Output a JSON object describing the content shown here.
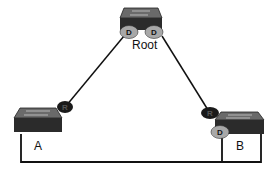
{
  "diagram": {
    "type": "spanning-tree-topology",
    "switches": [
      {
        "id": "root",
        "label": "Root"
      },
      {
        "id": "a",
        "label": "A"
      },
      {
        "id": "b",
        "label": "B"
      }
    ],
    "ports": [
      {
        "switch": "root",
        "role_label": "D",
        "style": "designated"
      },
      {
        "switch": "root",
        "role_label": "D",
        "style": "designated"
      },
      {
        "switch": "a",
        "role_label": "R",
        "style": "root-port"
      },
      {
        "switch": "b",
        "role_label": "R",
        "style": "root-port"
      },
      {
        "switch": "b",
        "role_label": "D",
        "style": "designated"
      }
    ],
    "colors": {
      "designated_port": "#a8a8a8",
      "root_port": "#1a1a1a",
      "switch_body": "#2b2b2b",
      "link": "#111111"
    }
  }
}
